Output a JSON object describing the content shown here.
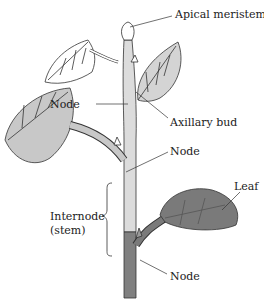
{
  "diagram": {
    "labels": {
      "apical_meristem": "Apical meristem",
      "node_upper": "Node",
      "axillary_bud": "Axillary bud",
      "node_middle": "Node",
      "internode_line1": "Internode",
      "internode_line2": "(stem)",
      "leaf": "Leaf",
      "node_lower": "Node"
    },
    "colors": {
      "stem_light": "#d9d9d9",
      "leaf_light": "#cfcfcf",
      "leaf_dark": "#7a7a7a",
      "stem_dark": "#808080",
      "outline": "#333333"
    }
  }
}
